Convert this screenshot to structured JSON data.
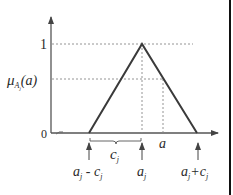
{
  "diagram": {
    "type": "triangular-membership-function",
    "colors": {
      "line": "#3a3a3a",
      "axis": "#555555",
      "dashed": "#888888",
      "border": "#111111",
      "background": "#ffffff"
    },
    "y_axis": {
      "ticks": [
        {
          "label": "1",
          "value": 1
        },
        {
          "label": "0",
          "value": 0
        }
      ],
      "level_label_main": "μ",
      "level_label_sub": "A",
      "level_label_subsub": "j",
      "level_label_arg": "(a)"
    },
    "x_axis": {
      "point_label": "a",
      "arrow_labels": {
        "left": {
          "main": "a",
          "sub": "j",
          "rest": " - c",
          "rest_sub": "j"
        },
        "center": {
          "main": "a",
          "sub": "j"
        },
        "right": {
          "main": "a",
          "sub": "j",
          "rest": "+c",
          "rest_sub": "j"
        }
      },
      "brace_label": {
        "main": "c",
        "sub": "j"
      }
    },
    "triangle": {
      "left_base": "a_j - c_j",
      "peak": "a_j",
      "right_base": "a_j + c_j",
      "peak_value": 1
    }
  }
}
